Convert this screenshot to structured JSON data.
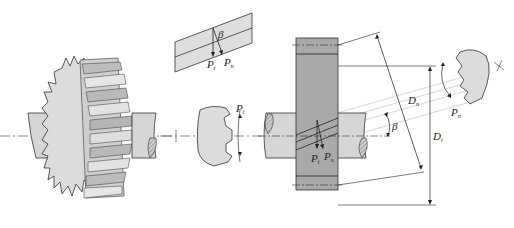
{
  "diagram": {
    "title": "",
    "colors": {
      "gear_fill": "#d9d9d9",
      "gear_face": "#cfcfcf",
      "gear_body_dark": "#a8a8a8",
      "shaft_fill": "#d6d6d6",
      "hatch": "#888888",
      "line": "#222222",
      "centerline": "#555555",
      "projection": "#bdbdbd"
    },
    "labels": {
      "inset_pt": "P",
      "inset_pt_sub": "t",
      "inset_pn": "P",
      "inset_pn_sub": "n",
      "inset_beta": "β",
      "section_pt": "P",
      "section_pt_sub": "t",
      "body_pt": "P",
      "body_pt_sub": "t",
      "body_pn": "P",
      "body_pn_sub": "n",
      "helix_angle": "β",
      "normal_diameter": "D",
      "normal_diameter_sub": "n",
      "transverse_diameter": "D",
      "transverse_diameter_sub": "t",
      "normal_section_pn": "P",
      "normal_section_pn_sub": "n"
    }
  }
}
